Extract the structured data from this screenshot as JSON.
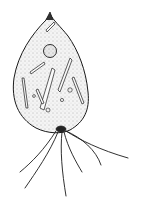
{
  "image": {
    "description": "Pen-and-ink stippled illustration of a flagellate protozoan cell with pointed apex, round nucleus, rod-shaped inclusions, and trailing flagella",
    "colors": {
      "ink": "#1a1a1a",
      "background": "#ffffff",
      "body_fill": "#f4f4f4"
    }
  }
}
